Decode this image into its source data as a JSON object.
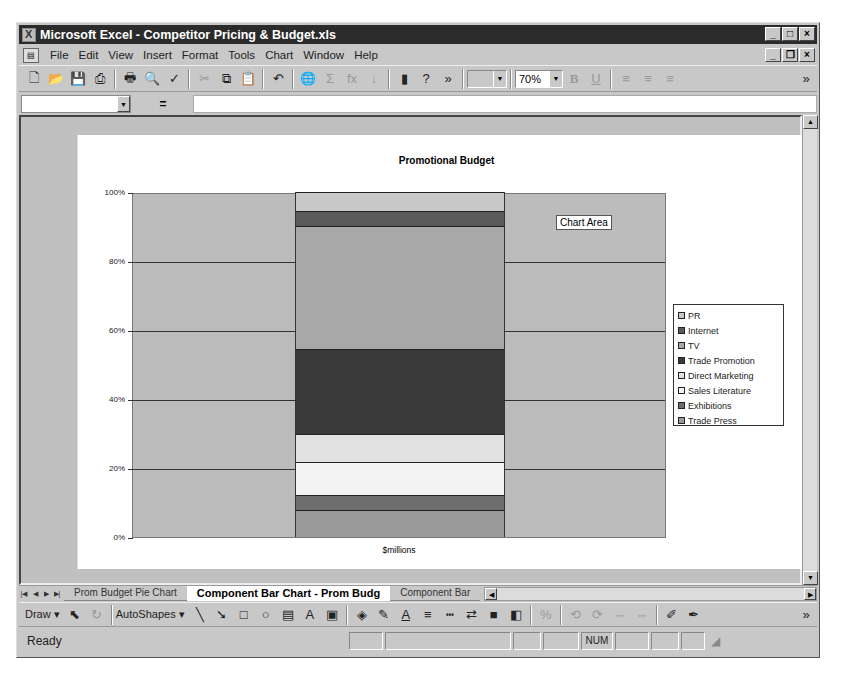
{
  "window": {
    "title": "Microsoft Excel - Competitor Pricing & Budget.xls",
    "controls": [
      "_",
      "□",
      "×"
    ],
    "doc_controls": [
      "_",
      "❐",
      "×"
    ]
  },
  "menu": {
    "items": [
      {
        "label": "File"
      },
      {
        "label": "Edit"
      },
      {
        "label": "View"
      },
      {
        "label": "Insert"
      },
      {
        "label": "Format"
      },
      {
        "label": "Tools"
      },
      {
        "label": "Chart"
      },
      {
        "label": "Window"
      },
      {
        "label": "Help"
      }
    ]
  },
  "toolbar": {
    "icons": [
      {
        "name": "new-icon",
        "glyph": "🗋"
      },
      {
        "name": "open-icon",
        "glyph": "📂"
      },
      {
        "name": "save-icon",
        "glyph": "💾"
      },
      {
        "name": "permission-icon",
        "glyph": "⎙"
      },
      {
        "name": "print-icon",
        "glyph": "🖶"
      },
      {
        "name": "print-preview-icon",
        "glyph": "🔍"
      },
      {
        "name": "spelling-icon",
        "glyph": "✓"
      },
      {
        "name": "cut-icon",
        "glyph": "✂"
      },
      {
        "name": "copy-icon",
        "glyph": "⧉"
      },
      {
        "name": "paste-icon",
        "glyph": "📋"
      },
      {
        "name": "undo-icon",
        "glyph": "↶"
      },
      {
        "name": "hyperlink-icon",
        "glyph": "🌐"
      },
      {
        "name": "autosum-icon",
        "glyph": "Σ"
      },
      {
        "name": "function-icon",
        "glyph": "fx"
      },
      {
        "name": "sort-icon",
        "glyph": "↓"
      },
      {
        "name": "chart-wizard-icon",
        "glyph": "▮"
      },
      {
        "name": "help-icon",
        "glyph": "?"
      }
    ],
    "font_combo": "",
    "zoom": "70%",
    "bold": "B",
    "underline": "U",
    "more": "»"
  },
  "formula_bar": {
    "name_box": "",
    "equals": "=",
    "formula": ""
  },
  "chart": {
    "tooltip": "Chart Area"
  },
  "chart_data": {
    "type": "bar",
    "stacked": "100%",
    "title": "Promotional Budget",
    "xlabel": "$millions",
    "ylabel": "",
    "categories": [
      "$millions"
    ],
    "y_ticks": [
      "0%",
      "20%",
      "40%",
      "60%",
      "80%",
      "100%"
    ],
    "ylim": [
      0,
      100
    ],
    "grid": true,
    "legend_position": "right",
    "series": [
      {
        "name": "Trade Press",
        "values": [
          7.8
        ],
        "color": "#9a9a9a"
      },
      {
        "name": "Exhibitions",
        "values": [
          4.3
        ],
        "color": "#6e6e6e"
      },
      {
        "name": "Sales Literature",
        "values": [
          9.6
        ],
        "color": "#f4f4f4"
      },
      {
        "name": "Direct Marketing",
        "values": [
          8.1
        ],
        "color": "#e2e2e2"
      },
      {
        "name": "Trade Promotion",
        "values": [
          24.6
        ],
        "color": "#3a3a3a"
      },
      {
        "name": "TV",
        "values": [
          35.7
        ],
        "color": "#a8a8a8"
      },
      {
        "name": "Internet",
        "values": [
          4.3
        ],
        "color": "#5a5a5a"
      },
      {
        "name": "PR",
        "values": [
          5.5
        ],
        "color": "#c8c8c8"
      }
    ],
    "legend": [
      "PR",
      "Internet",
      "TV",
      "Trade Promotion",
      "Direct Marketing",
      "Sales Literature",
      "Exhibitions",
      "Trade Press"
    ]
  },
  "sheet_tabs": {
    "nav": [
      "|◀",
      "◀",
      "▶",
      "▶|"
    ],
    "tabs": [
      {
        "label": "Prom Budget Pie Chart",
        "active": false
      },
      {
        "label": "Component Bar Chart - Prom Budg",
        "active": true
      },
      {
        "label": "Component Bar",
        "active": false
      }
    ]
  },
  "draw_toolbar": {
    "draw": "Draw ▾",
    "autoshapes": "AutoShapes ▾",
    "icons": [
      {
        "name": "select-objects-icon",
        "glyph": "⬉"
      },
      {
        "name": "free-rotate-icon",
        "glyph": "↻"
      },
      {
        "name": "line-icon",
        "glyph": "╲"
      },
      {
        "name": "arrow-icon",
        "glyph": "➘"
      },
      {
        "name": "rectangle-icon",
        "glyph": "□"
      },
      {
        "name": "oval-icon",
        "glyph": "○"
      },
      {
        "name": "textbox-icon",
        "glyph": "▤"
      },
      {
        "name": "wordart-icon",
        "glyph": "A"
      },
      {
        "name": "clipart-icon",
        "glyph": "▣"
      },
      {
        "name": "fill-color-icon",
        "glyph": "◈"
      },
      {
        "name": "line-color-icon",
        "glyph": "✎"
      },
      {
        "name": "font-color-icon",
        "glyph": "A"
      },
      {
        "name": "line-style-icon",
        "glyph": "≡"
      },
      {
        "name": "dash-style-icon",
        "glyph": "┅"
      },
      {
        "name": "arrow-style-icon",
        "glyph": "⇄"
      },
      {
        "name": "shadow-icon",
        "glyph": "■"
      },
      {
        "name": "3d-icon",
        "glyph": "◧"
      },
      {
        "name": "percent-icon",
        "glyph": "%"
      },
      {
        "name": "rotate-icon",
        "glyph": "⟲"
      },
      {
        "name": "rotate2-icon",
        "glyph": "⟳"
      },
      {
        "name": "flip-icon",
        "glyph": "⇔"
      },
      {
        "name": "flip2-icon",
        "glyph": "⇔"
      },
      {
        "name": "edit-points-icon",
        "glyph": "✐"
      },
      {
        "name": "pen-icon",
        "glyph": "✒"
      }
    ],
    "more": "»"
  },
  "status": {
    "text": "Ready",
    "num": "NUM"
  }
}
